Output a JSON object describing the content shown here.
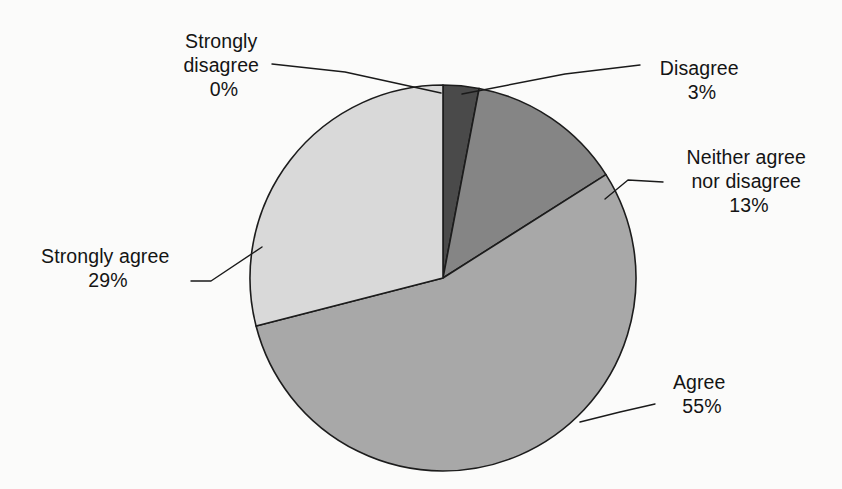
{
  "chart_data": {
    "type": "pie",
    "title": "",
    "subtitle": "",
    "xlabel": "",
    "ylabel": "",
    "legend_position": "none",
    "grid": false,
    "units": "percent",
    "start_angle_deg": 0,
    "direction": "clockwise",
    "categories": [
      "Disagree",
      "Neither agree nor disagree",
      "Agree",
      "Strongly agree",
      "Strongly disagree"
    ],
    "values": [
      3,
      13,
      55,
      29,
      0
    ],
    "value_labels": [
      "3%",
      "13%",
      "55%",
      "29%",
      "0%"
    ],
    "colors": [
      "#4a4a4a",
      "#858585",
      "#a8a8a8",
      "#d9d9d9",
      "#f0f0f0"
    ],
    "slices": [
      {
        "name": "Disagree",
        "value": 3,
        "value_label": "3%",
        "color": "#4a4a4a",
        "start_deg": 0,
        "end_deg": 10.8
      },
      {
        "name": "Neither agree nor disagree",
        "value": 13,
        "value_label": "13%",
        "color": "#858585",
        "start_deg": 10.8,
        "end_deg": 57.6
      },
      {
        "name": "Agree",
        "value": 55,
        "value_label": "55%",
        "color": "#a8a8a8",
        "start_deg": 57.6,
        "end_deg": 255.6
      },
      {
        "name": "Strongly agree",
        "value": 29,
        "value_label": "29%",
        "color": "#d9d9d9",
        "start_deg": 255.6,
        "end_deg": 360
      },
      {
        "name": "Strongly disagree",
        "value": 0,
        "value_label": "0%",
        "color": "#f0f0f0",
        "start_deg": 360,
        "end_deg": 360
      }
    ]
  },
  "labels": {
    "strongly_disagree": {
      "line1": "Strongly",
      "line2": "disagree",
      "percent": "0%"
    },
    "disagree": {
      "line1": "Disagree",
      "percent": "3%"
    },
    "neither": {
      "line1": "Neither agree",
      "line2": "nor disagree",
      "percent": "13%"
    },
    "strongly_agree": {
      "line1": "Strongly agree",
      "percent": "29%"
    },
    "agree": {
      "line1": "Agree",
      "percent": "55%"
    }
  },
  "style": {
    "background": "#fbfbfa",
    "outline": "#1c1c1c",
    "text": "#141414"
  }
}
